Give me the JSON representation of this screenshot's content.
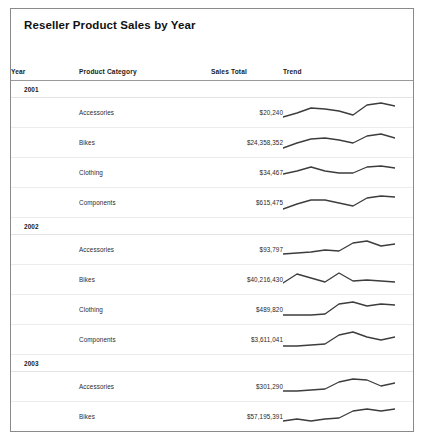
{
  "report": {
    "title": "Reseller Product Sales by Year",
    "columns": {
      "year": "Year",
      "category": "Product Category",
      "total": "Sales Total",
      "trend": "Trend"
    },
    "groups": [
      {
        "year": "2001",
        "rows": [
          {
            "category": "Accessories",
            "total": "$20,240",
            "spark": "0,15 14,11 28,6 42,7 56,9 70,13 84,3 98,1 112,4"
          },
          {
            "category": "Bikes",
            "total": "$24,358,352",
            "spark": "0,16 14,11 28,7 42,6 56,8 70,11 84,4 98,2 112,6"
          },
          {
            "category": "Clothing",
            "total": "$34,467",
            "spark": "0,12 14,9 28,5 42,9 56,11 70,11 84,5 98,4 112,6"
          },
          {
            "category": "Components",
            "total": "$615,475",
            "spark": "0,17 14,12 28,8 42,8 56,11 70,14 84,6 98,4 112,5"
          }
        ]
      },
      {
        "year": "2002",
        "rows": [
          {
            "category": "Accessories",
            "total": "$93,797",
            "spark": "0,15 14,14 28,13 42,11 56,12 70,4 84,2 98,7 112,5"
          },
          {
            "category": "Bikes",
            "total": "$40,216,430",
            "spark": "0,14 14,5 28,9 42,13 56,4 70,12 84,11 98,12 112,13"
          },
          {
            "category": "Clothing",
            "total": "$489,820",
            "spark": "0,16 14,16 28,16 42,15 56,5 70,3 84,7 98,5 112,6"
          },
          {
            "category": "Components",
            "total": "$3,611,041",
            "spark": "0,17 14,17 28,16 42,15 56,6 70,3 84,8 98,11 112,8"
          }
        ]
      },
      {
        "year": "2003",
        "rows": [
          {
            "category": "Accessories",
            "total": "$301,290",
            "spark": "0,15 14,15 28,14 42,13 56,6 70,3 84,4 98,10 112,7"
          },
          {
            "category": "Bikes",
            "total": "$57,195,391",
            "spark": "0,15 14,13 28,15 42,13 56,12 70,5 84,3 98,5 112,3"
          },
          {
            "category": "Clothing",
            "total": "$884,354",
            "spark": "0,16 14,14 28,15 42,11 56,13 70,6 84,4 98,10 112,8"
          },
          {
            "category": "Components",
            "total": "$5,486,723",
            "spark": "0,18 14,16 28,16 42,12 56,11 70,6 84,4 98,14 112,10"
          }
        ]
      }
    ]
  }
}
